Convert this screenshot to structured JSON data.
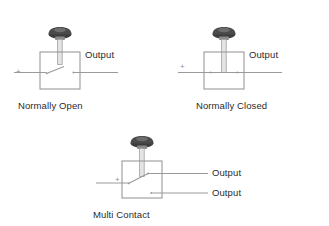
{
  "diagram": {
    "title_present": false,
    "background_color": "#ffffff",
    "line_color": "#9a9a9a",
    "cap_color_dark": "#3a3a3a",
    "cap_color_light": "#b8b8b8",
    "text_color": "#2b2b2b",
    "plus_color": "#8e8e8e",
    "units": [
      {
        "id": "normally-open",
        "caption": "Normally Open",
        "terminal_marker": "+",
        "outputs": [
          {
            "label": "Output"
          }
        ],
        "contact_state": "open"
      },
      {
        "id": "normally-closed",
        "caption": "Normally Closed",
        "terminal_marker": "+",
        "outputs": [
          {
            "label": "Output"
          }
        ],
        "contact_state": "closed"
      },
      {
        "id": "multi-contact",
        "caption": "Multi Contact",
        "terminal_marker": "+",
        "outputs": [
          {
            "label": "Output"
          },
          {
            "label": "Output"
          }
        ],
        "contact_state": "multi"
      }
    ]
  }
}
